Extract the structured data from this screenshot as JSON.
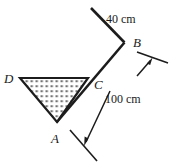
{
  "figure": {
    "type": "geometry-diagram",
    "background_color": "#ffffff",
    "ink_color": "#1c1c1c",
    "vertex_labels": [
      {
        "id": "A",
        "text": "A",
        "x": 57,
        "y": 122,
        "label_x": 52,
        "label_y": 140
      },
      {
        "id": "B",
        "text": "B",
        "x": 124,
        "y": 42,
        "label_x": 134,
        "label_y": 46
      },
      {
        "id": "C",
        "text": "C",
        "x": 88,
        "y": 78,
        "label_x": 95,
        "label_y": 88
      },
      {
        "id": "D",
        "text": "D",
        "x": 20,
        "y": 78,
        "label_x": 4,
        "label_y": 79
      }
    ],
    "dimensions": [
      {
        "id": "upper",
        "text": "40 cm",
        "label_x": 106,
        "label_y": 20,
        "value": 40,
        "unit": "cm"
      },
      {
        "id": "lower",
        "text": "100 cm",
        "label_x": 108,
        "label_y": 100,
        "value": 100,
        "unit": "cm"
      }
    ],
    "segments": [
      {
        "id": "top-arm",
        "from": [
          91,
          8
        ],
        "to": [
          124,
          42
        ]
      },
      {
        "id": "lower-arm",
        "from": [
          124,
          42
        ],
        "to": [
          57,
          122
        ]
      }
    ],
    "liquid": {
      "id": "liquid-region",
      "polygon": "20,78 88,78 57,122",
      "fill_pattern": "stipple-dots",
      "fill_color": "#ffffff",
      "dot_color": "#2a2a2a"
    }
  }
}
